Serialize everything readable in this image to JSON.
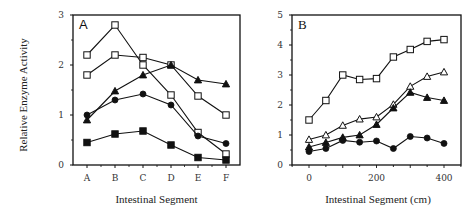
{
  "figure": {
    "ylabel": "Relative   Enzyme   Activity"
  },
  "chart_data": [
    {
      "panel": "A",
      "type": "line",
      "title": "A",
      "xlabel": "Intestinal   Segment",
      "ylabel": "Relative Enzyme Activity",
      "categories": [
        "A",
        "B",
        "C",
        "D",
        "E",
        "F"
      ],
      "ylim": [
        0,
        3
      ],
      "yticks": [
        0,
        1,
        2,
        3
      ],
      "grid": false,
      "series": [
        {
          "name": "open-square-1",
          "marker": "open-square",
          "values": [
            2.2,
            2.8,
            2.0,
            1.4,
            0.65,
            0.22
          ]
        },
        {
          "name": "open-square-2",
          "marker": "open-square",
          "values": [
            1.8,
            2.2,
            2.15,
            2.0,
            1.38,
            1.0
          ]
        },
        {
          "name": "filled-triangle",
          "marker": "filled-triangle",
          "values": [
            0.9,
            1.48,
            1.8,
            2.0,
            1.7,
            1.62
          ]
        },
        {
          "name": "filled-circle",
          "marker": "filled-circle",
          "values": [
            1.0,
            1.3,
            1.42,
            1.2,
            0.58,
            0.43
          ]
        },
        {
          "name": "filled-square",
          "marker": "filled-square",
          "values": [
            0.45,
            0.62,
            0.68,
            0.4,
            0.15,
            0.1
          ]
        }
      ]
    },
    {
      "panel": "B",
      "type": "line",
      "title": "B",
      "xlabel": "Intestinal   Segment   (cm)",
      "ylabel": "",
      "x": [
        0,
        50,
        100,
        150,
        200,
        250,
        300,
        350,
        400
      ],
      "xticks": [
        0,
        200,
        400
      ],
      "ylim": [
        0,
        5
      ],
      "yticks": [
        0,
        1,
        2,
        3,
        4,
        5
      ],
      "grid": false,
      "series": [
        {
          "name": "open-square",
          "marker": "open-square",
          "values": [
            1.5,
            2.15,
            3.0,
            2.85,
            2.88,
            3.6,
            3.85,
            4.12,
            4.18
          ]
        },
        {
          "name": "open-triangle",
          "marker": "open-triangle",
          "values": [
            0.85,
            1.0,
            1.32,
            1.53,
            1.6,
            2.02,
            2.62,
            2.95,
            3.1
          ]
        },
        {
          "name": "filled-triangle",
          "marker": "filled-triangle",
          "values": [
            0.6,
            0.75,
            0.92,
            1.0,
            1.35,
            1.9,
            2.42,
            2.25,
            2.15
          ]
        },
        {
          "name": "filled-circle",
          "marker": "filled-circle",
          "values": [
            0.45,
            0.55,
            0.82,
            0.76,
            0.8,
            0.55,
            0.95,
            0.9,
            0.72
          ]
        }
      ]
    }
  ]
}
